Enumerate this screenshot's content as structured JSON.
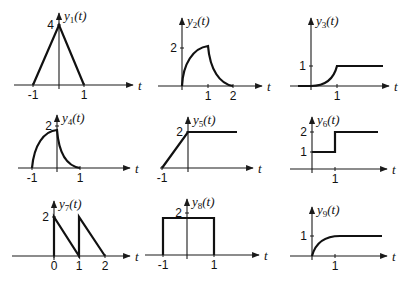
{
  "figure": {
    "axis_variable": "t",
    "plots": [
      {
        "id": "y1",
        "name_base": "y",
        "name_sub": "1",
        "name_arg": "(t)",
        "origin": [
          59,
          85
        ],
        "y_axis_top": 13,
        "t_axis": [
          14,
          133
        ],
        "path": "M33,85 L59,25 L84,85",
        "t_ticks": [
          {
            "label": "-1",
            "x": 33
          },
          {
            "label": "1",
            "x": 84
          }
        ],
        "y_ticks": [
          {
            "label": "4",
            "y": 25,
            "side": "left"
          }
        ],
        "description": "Triangle pulse from t=-1 to t=1, peak 4 at t=0"
      },
      {
        "id": "y2",
        "name_base": "y",
        "name_sub": "2",
        "name_arg": "(t)",
        "origin": [
          182,
          86
        ],
        "y_axis_top": 18,
        "t_axis": [
          158,
          262
        ],
        "path": "M182,86 C183,64 193,48 208,46 L208,46 C210,70 220,84 233,86",
        "t_ticks": [
          {
            "label": "1",
            "x": 208
          },
          {
            "label": "2",
            "x": 233
          }
        ],
        "y_ticks": [
          {
            "label": "2",
            "y": 48,
            "side": "left"
          }
        ],
        "description": "Rising concave curve from 0 to 2 at t=1, then decaying to 0 at t=2"
      },
      {
        "id": "y3",
        "name_base": "y",
        "name_sub": "3",
        "name_arg": "(t)",
        "origin": [
          311,
          86
        ],
        "y_axis_top": 18,
        "t_axis": [
          290,
          389
        ],
        "path": "M298,86 L311,86 C322,86 333,82 337,66 L383,66",
        "t_ticks": [
          {
            "label": "1",
            "x": 337
          }
        ],
        "y_ticks": [
          {
            "label": "1",
            "y": 66,
            "side": "left"
          }
        ],
        "description": "Convex rise from 0 at t=0 to 1 at t=1, then constant 1"
      },
      {
        "id": "y4",
        "name_base": "y",
        "name_sub": "4",
        "name_arg": "(t)",
        "origin": [
          57,
          168
        ],
        "y_axis_top": 115,
        "t_axis": [
          18,
          130
        ],
        "path": "M32,168 C34,145 44,131 57,130 L57,130 C59,155 67,166 80,168",
        "t_ticks": [
          {
            "label": "-1",
            "x": 32
          },
          {
            "label": "1",
            "x": 80
          }
        ],
        "y_ticks": [
          {
            "label": "2",
            "y": 126,
            "side": "left"
          }
        ],
        "description": "Concave rise from 0 at t=-1 to 2 at t=0, then exponential decay to ~0 at t=1"
      },
      {
        "id": "y5",
        "name_base": "y",
        "name_sub": "5",
        "name_arg": "(t)",
        "origin": [
          188,
          168
        ],
        "y_axis_top": 117,
        "t_axis": [
          160,
          253
        ],
        "path": "M162,168 L188,132 L237,132",
        "t_ticks": [
          {
            "label": "-1",
            "x": 162
          }
        ],
        "y_ticks": [
          {
            "label": "2",
            "y": 132,
            "side": "left"
          }
        ],
        "description": "Linear ramp from 0 at t=-1 to 2 at t=0, then constant 2"
      },
      {
        "id": "y6",
        "name_base": "y",
        "name_sub": "6",
        "name_arg": "(t)",
        "origin": [
          312,
          169
        ],
        "y_axis_top": 117,
        "t_axis": [
          290,
          387
        ],
        "path": "M312,152 L335,152 L335,132 L378,132",
        "t_ticks": [
          {
            "label": "1",
            "x": 335
          }
        ],
        "y_ticks": [
          {
            "label": "2",
            "y": 132,
            "side": "left"
          },
          {
            "label": "1",
            "y": 152,
            "side": "left"
          }
        ],
        "description": "Step: 1 for 0<t<1, then 2 for t>1"
      },
      {
        "id": "y7",
        "name_base": "y",
        "name_sub": "7",
        "name_arg": "(t)",
        "origin": [
          54,
          256
        ],
        "y_axis_top": 201,
        "t_axis": [
          12,
          130
        ],
        "path": "M54,256 L54,217 L79,256 L79,217 L105,256",
        "t_ticks": [
          {
            "label": "0",
            "x": 54
          },
          {
            "label": "1",
            "x": 79
          },
          {
            "label": "2",
            "x": 105
          }
        ],
        "y_ticks": [
          {
            "label": "2",
            "y": 217,
            "side": "left"
          }
        ],
        "description": "Two sawtooth ramps: jump to 2 at t=0 decreasing to 0 at t=1, jump to 2 at t=1 decreasing to 0 at t=2"
      },
      {
        "id": "y8",
        "name_base": "y",
        "name_sub": "8",
        "name_arg": "(t)",
        "origin": [
          187,
          255
        ],
        "y_axis_top": 199,
        "t_axis": [
          145,
          259
        ],
        "path": "M163,255 L163,218 L214,218 L214,255",
        "t_ticks": [
          {
            "label": "-1",
            "x": 163
          },
          {
            "label": "1",
            "x": 214
          }
        ],
        "y_ticks": [
          {
            "label": "2",
            "y": 213,
            "side": "left"
          }
        ],
        "description": "Rectangular pulse of height 2 from t=-1 to t=1"
      },
      {
        "id": "y9",
        "name_base": "y",
        "name_sub": "9",
        "name_arg": "(t)",
        "origin": [
          312,
          256
        ],
        "y_axis_top": 207,
        "t_axis": [
          290,
          387
        ],
        "path": "M312,256 C316,241 326,236 340,236 L382,236",
        "t_ticks": [
          {
            "label": "1",
            "x": 335
          }
        ],
        "y_ticks": [
          {
            "label": "1",
            "y": 236,
            "side": "left"
          }
        ],
        "description": "Exponential rise from 0 at t=0 approaching 1"
      }
    ]
  }
}
